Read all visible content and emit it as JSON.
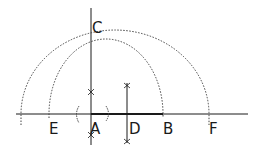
{
  "diagram": {
    "type": "geometric-construction",
    "points": {
      "A": {
        "label": "A"
      },
      "B": {
        "label": "B"
      },
      "C": {
        "label": "C"
      },
      "D": {
        "label": "D"
      },
      "E": {
        "label": "E"
      },
      "F": {
        "label": "F"
      }
    },
    "colors": {
      "ink": "#1a1a1a",
      "dotted": "#444444"
    }
  }
}
